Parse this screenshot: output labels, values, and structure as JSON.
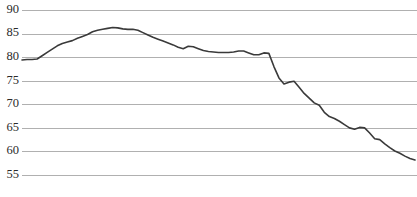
{
  "chart_data": {
    "type": "line",
    "title": "",
    "title_visible_fragment": "",
    "xlabel": "",
    "ylabel": "",
    "ylim": [
      55,
      90
    ],
    "ytick_labels": [
      "90",
      "85",
      "80",
      "75",
      "70",
      "65",
      "60",
      "55"
    ],
    "ytick_values": [
      90,
      85,
      80,
      75,
      70,
      65,
      60,
      55
    ],
    "xtick_labels": [],
    "grid": true,
    "grid_axis": "y",
    "legend": false,
    "legend_position": "none",
    "line_color": "#3a3a3a",
    "grid_color": "#b0b0b0",
    "background_color": "#ffffff",
    "x": [
      0,
      1,
      2,
      3,
      4,
      5,
      6,
      7,
      8,
      9,
      10,
      11,
      12,
      13,
      14,
      15,
      16,
      17,
      18,
      19,
      20,
      21,
      22,
      23,
      24,
      25,
      26,
      27,
      28,
      29,
      30,
      31,
      32,
      33,
      34,
      35,
      36,
      37,
      38,
      39,
      40,
      41,
      42,
      43,
      44,
      45,
      46,
      47,
      48,
      49,
      50,
      51,
      52,
      53,
      54,
      55,
      56,
      57,
      58,
      59,
      60,
      61,
      62,
      63,
      64,
      65
    ],
    "values": [
      79.4,
      79.5,
      79.5,
      79.6,
      80.3,
      81.0,
      81.7,
      82.4,
      82.9,
      83.2,
      83.5,
      84.0,
      84.4,
      84.8,
      85.4,
      85.7,
      85.9,
      86.1,
      86.3,
      86.2,
      86.0,
      85.9,
      85.9,
      85.7,
      85.2,
      84.7,
      84.2,
      83.8,
      83.4,
      83.0,
      82.6,
      82.1,
      81.8,
      82.3,
      82.2,
      81.8,
      81.4,
      81.2,
      81.1,
      81.0,
      81.0,
      81.0,
      81.1,
      81.3,
      81.3,
      80.9,
      80.5,
      80.5,
      80.9,
      80.8,
      78.0,
      75.6,
      74.3,
      74.7,
      74.9,
      73.6,
      72.3,
      71.3,
      70.3,
      69.8,
      68.3,
      67.4,
      67.0,
      66.4,
      65.7,
      65.0
    ],
    "values_tail": [
      64.7,
      65.1,
      65.0,
      63.9,
      62.7,
      62.5,
      61.6,
      60.8,
      60.1,
      59.6,
      59.0,
      58.5,
      58.2
    ],
    "series_min": 58.2,
    "series_max": 86.3,
    "series_start": 79.4,
    "series_end": 58.2
  },
  "axis": {
    "y_label_font_size": "12.5px"
  }
}
